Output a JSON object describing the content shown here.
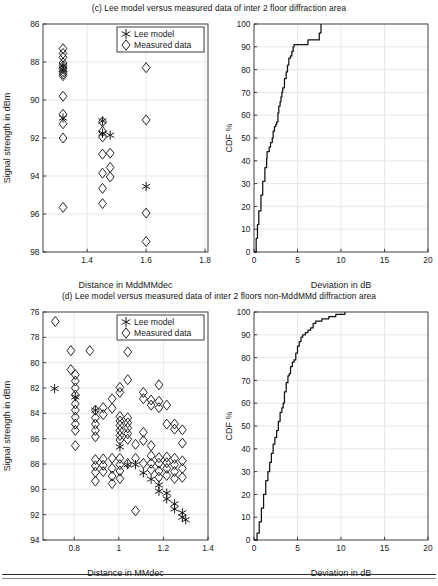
{
  "figure": {
    "panels": [
      {
        "id": "c",
        "caption": "(c) Lee model versus measured data of inter 2 floor diffraction area",
        "charts": [
          "c-scatter",
          "c-cdf"
        ]
      },
      {
        "id": "d",
        "caption": "(d) Lee model versus measured data of inter 2 floors non-MddMMd diffraction area",
        "charts": [
          "d-scatter",
          "d-cdf"
        ]
      }
    ],
    "legend_labels": {
      "lee_model": "Lee model",
      "measured_data": "Measured data"
    },
    "markers": {
      "lee_model": "asterisk",
      "measured_data": "diamond"
    },
    "colors": {
      "ink": "#1a1a1a",
      "axis": "#2b2b2b",
      "grid": "#d8d8d8",
      "curve": "#111111"
    }
  },
  "chart_data": [
    {
      "id": "c-scatter",
      "type": "scatter",
      "title": "(c) Lee model versus measured data of inter 2 floor diffraction area",
      "xlabel": "Distance in MddMMdec",
      "ylabel": "Signal strength in dBm",
      "xlim": [
        1.25,
        1.81
      ],
      "ylim": [
        86,
        98
      ],
      "y_inverted": true,
      "xticks": [
        1.4,
        1.6,
        1.8
      ],
      "xticklabels": [
        "1.4",
        "1.6",
        "1.8"
      ],
      "yticks": [
        86,
        88,
        90,
        92,
        94,
        96,
        98
      ],
      "yticklabels": [
        "86",
        "88",
        "90",
        "92",
        "94",
        "96",
        "98"
      ],
      "grid": true,
      "legend_position": "top-right",
      "series": [
        {
          "name": "Measured data",
          "marker": "diamond",
          "points": [
            [
              1.318,
              87.3
            ],
            [
              1.318,
              87.55
            ],
            [
              1.318,
              87.75
            ],
            [
              1.318,
              88.05
            ],
            [
              1.318,
              88.2
            ],
            [
              1.318,
              88.35
            ],
            [
              1.318,
              88.5
            ],
            [
              1.318,
              88.62
            ],
            [
              1.318,
              88.72
            ],
            [
              1.318,
              89.8
            ],
            [
              1.318,
              90.75
            ],
            [
              1.318,
              91.25
            ],
            [
              1.318,
              92.0
            ],
            [
              1.318,
              95.65
            ],
            [
              1.452,
              91.15
            ],
            [
              1.452,
              91.65
            ],
            [
              1.452,
              91.95
            ],
            [
              1.452,
              92.85
            ],
            [
              1.452,
              93.85
            ],
            [
              1.452,
              94.65
            ],
            [
              1.452,
              95.45
            ],
            [
              1.478,
              92.8
            ],
            [
              1.478,
              93.55
            ],
            [
              1.478,
              94.05
            ],
            [
              1.6,
              88.3
            ],
            [
              1.6,
              91.05
            ],
            [
              1.6,
              95.95
            ],
            [
              1.6,
              97.45
            ]
          ]
        },
        {
          "name": "Lee model",
          "marker": "asterisk",
          "points": [
            [
              1.318,
              88.2
            ],
            [
              1.318,
              88.4
            ],
            [
              1.318,
              90.95
            ],
            [
              1.452,
              91.1
            ],
            [
              1.452,
              91.75
            ],
            [
              1.478,
              91.85
            ],
            [
              1.6,
              94.55
            ]
          ]
        }
      ]
    },
    {
      "id": "c-cdf",
      "type": "line",
      "xlabel": "Deviation in dB",
      "ylabel": "CDF %",
      "xlim": [
        0,
        20
      ],
      "ylim": [
        0,
        100
      ],
      "xticks": [
        0,
        5,
        10,
        15,
        20
      ],
      "xticklabels": [
        "0",
        "5",
        "10",
        "15",
        "20"
      ],
      "yticks": [
        0,
        10,
        20,
        30,
        40,
        50,
        60,
        70,
        80,
        90,
        100
      ],
      "yticklabels": [
        "0",
        "10",
        "20",
        "30",
        "40",
        "50",
        "60",
        "70",
        "80",
        "90",
        "100"
      ],
      "grid": true,
      "series": [
        {
          "name": "CDF",
          "x": [
            0.05,
            0.25,
            0.4,
            0.55,
            0.8,
            1.0,
            1.25,
            1.45,
            1.5,
            1.75,
            1.9,
            2.1,
            2.2,
            2.35,
            2.5,
            2.6,
            2.75,
            2.85,
            3.0,
            3.1,
            3.2,
            3.3,
            3.45,
            3.5,
            3.7,
            3.85,
            4.0,
            4.2,
            4.35,
            4.5,
            4.6,
            6.1,
            6.2,
            6.45,
            7.4,
            7.5,
            7.65,
            7.7
          ],
          "y": [
            0,
            6,
            12,
            18,
            25,
            31,
            37,
            41,
            44,
            46,
            48,
            50,
            53,
            55,
            56,
            57,
            61,
            64,
            66,
            68,
            70,
            72,
            72,
            76,
            79,
            82,
            85,
            86,
            88,
            90,
            91,
            91,
            93,
            93,
            93,
            96,
            96,
            100
          ]
        }
      ]
    },
    {
      "id": "d-scatter",
      "type": "scatter",
      "title": "(d) Lee model versus measured data of inter 2 floors non-MddMMd diffraction area",
      "xlabel": "Distance in MMdec",
      "ylabel": "Signal strength in dBm",
      "xlim": [
        0.66,
        1.4
      ],
      "ylim": [
        76,
        94
      ],
      "y_inverted": true,
      "xticks": [
        0.8,
        1.0,
        1.2,
        1.4
      ],
      "xticklabels": [
        "0.8",
        "1",
        "1.2",
        "1.4"
      ],
      "yticks": [
        76,
        78,
        80,
        82,
        84,
        86,
        88,
        90,
        92,
        94
      ],
      "yticklabels": [
        "76",
        "78",
        "80",
        "82",
        "84",
        "86",
        "88",
        "90",
        "92",
        "94"
      ],
      "grid": true,
      "legend_position": "top-right",
      "series": [
        {
          "name": "Measured data",
          "marker": "diamond",
          "points": [
            [
              0.715,
              76.75
            ],
            [
              0.785,
              79.05
            ],
            [
              0.785,
              80.55
            ],
            [
              0.805,
              80.95
            ],
            [
              0.805,
              81.45
            ],
            [
              0.805,
              82.0
            ],
            [
              0.805,
              82.55
            ],
            [
              0.805,
              83.25
            ],
            [
              0.805,
              83.75
            ],
            [
              0.805,
              84.3
            ],
            [
              0.805,
              84.85
            ],
            [
              0.805,
              85.35
            ],
            [
              0.805,
              86.55
            ],
            [
              0.87,
              79.05
            ],
            [
              0.895,
              83.75
            ],
            [
              0.895,
              84.35
            ],
            [
              0.895,
              84.85
            ],
            [
              0.895,
              85.35
            ],
            [
              0.895,
              85.85
            ],
            [
              0.895,
              87.65
            ],
            [
              0.895,
              88.15
            ],
            [
              0.895,
              88.65
            ],
            [
              0.895,
              89.35
            ],
            [
              0.93,
              83.55
            ],
            [
              0.93,
              84.1
            ],
            [
              0.93,
              87.6
            ],
            [
              0.93,
              88.1
            ],
            [
              0.93,
              88.6
            ],
            [
              0.97,
              82.85
            ],
            [
              0.97,
              83.6
            ],
            [
              0.97,
              87.55
            ],
            [
              0.97,
              88.35
            ],
            [
              0.97,
              88.95
            ],
            [
              0.97,
              89.55
            ],
            [
              1.005,
              81.95
            ],
            [
              1.005,
              82.35
            ],
            [
              1.005,
              84.25
            ],
            [
              1.005,
              84.6
            ],
            [
              1.005,
              84.95
            ],
            [
              1.005,
              85.35
            ],
            [
              1.005,
              85.75
            ],
            [
              1.005,
              86.1
            ],
            [
              1.005,
              87.55
            ],
            [
              1.005,
              88.05
            ],
            [
              1.005,
              88.55
            ],
            [
              1.005,
              89.15
            ],
            [
              1.04,
              79.15
            ],
            [
              1.04,
              81.35
            ],
            [
              1.04,
              84.35
            ],
            [
              1.04,
              84.75
            ],
            [
              1.04,
              85.15
            ],
            [
              1.04,
              85.6
            ],
            [
              1.04,
              86.05
            ],
            [
              1.04,
              87.95
            ],
            [
              1.075,
              86.45
            ],
            [
              1.075,
              87.55
            ],
            [
              1.075,
              91.7
            ],
            [
              1.11,
              82.35
            ],
            [
              1.11,
              82.85
            ],
            [
              1.11,
              85.5
            ],
            [
              1.11,
              86.15
            ],
            [
              1.11,
              87.95
            ],
            [
              1.145,
              82.95
            ],
            [
              1.145,
              83.35
            ],
            [
              1.145,
              86.55
            ],
            [
              1.145,
              87.35
            ],
            [
              1.145,
              87.95
            ],
            [
              1.145,
              88.45
            ],
            [
              1.18,
              81.75
            ],
            [
              1.18,
              83.05
            ],
            [
              1.18,
              83.55
            ],
            [
              1.18,
              87.5
            ],
            [
              1.18,
              87.95
            ],
            [
              1.18,
              88.55
            ],
            [
              1.18,
              89.05
            ],
            [
              1.215,
              83.35
            ],
            [
              1.215,
              84.85
            ],
            [
              1.215,
              87.45
            ],
            [
              1.215,
              87.9
            ],
            [
              1.215,
              88.35
            ],
            [
              1.215,
              88.9
            ],
            [
              1.25,
              84.85
            ],
            [
              1.25,
              85.25
            ],
            [
              1.25,
              87.55
            ],
            [
              1.25,
              88.05
            ],
            [
              1.25,
              88.6
            ],
            [
              1.25,
              89.15
            ],
            [
              1.285,
              85.3
            ],
            [
              1.285,
              86.35
            ],
            [
              1.285,
              87.75
            ],
            [
              1.285,
              88.35
            ],
            [
              1.285,
              89.05
            ]
          ]
        },
        {
          "name": "Lee model",
          "marker": "asterisk",
          "points": [
            [
              0.712,
              82.05
            ],
            [
              0.805,
              82.7
            ],
            [
              0.895,
              83.75
            ],
            [
              1.005,
              86.65
            ],
            [
              1.04,
              88.05
            ],
            [
              1.075,
              88.05
            ],
            [
              1.11,
              88.7
            ],
            [
              1.145,
              89.2
            ],
            [
              1.18,
              89.65
            ],
            [
              1.18,
              90.15
            ],
            [
              1.215,
              90.3
            ],
            [
              1.215,
              90.75
            ],
            [
              1.25,
              91.15
            ],
            [
              1.25,
              91.55
            ],
            [
              1.285,
              91.85
            ],
            [
              1.285,
              92.2
            ],
            [
              1.3,
              92.4
            ]
          ]
        }
      ]
    },
    {
      "id": "d-cdf",
      "type": "line",
      "xlabel": "Deviation in dB",
      "ylabel": "CDF %",
      "xlim": [
        0,
        20
      ],
      "ylim": [
        0,
        100
      ],
      "xticks": [
        0,
        5,
        10,
        15,
        20
      ],
      "xticklabels": [
        "0",
        "5",
        "10",
        "15",
        "20"
      ],
      "yticks": [
        0,
        10,
        20,
        30,
        40,
        50,
        60,
        70,
        80,
        90,
        100
      ],
      "yticklabels": [
        "0",
        "10",
        "20",
        "30",
        "40",
        "50",
        "60",
        "70",
        "80",
        "90",
        "100"
      ],
      "grid": true,
      "series": [
        {
          "name": "CDF",
          "x": [
            0.1,
            0.35,
            0.6,
            0.85,
            1.1,
            1.35,
            1.6,
            1.8,
            2.0,
            2.2,
            2.4,
            2.6,
            2.8,
            3.0,
            3.2,
            3.35,
            3.5,
            3.7,
            3.9,
            4.05,
            4.2,
            4.4,
            4.6,
            4.8,
            5.0,
            5.2,
            5.4,
            5.6,
            5.9,
            6.2,
            6.5,
            6.8,
            7.1,
            7.4,
            7.8,
            8.2,
            8.6,
            9.0,
            9.4,
            9.8,
            10.2,
            10.45
          ],
          "y": [
            0,
            3,
            8,
            14,
            20,
            26,
            30,
            34,
            38,
            42,
            45,
            48,
            52,
            56,
            58,
            60,
            65,
            69,
            72,
            73,
            76,
            78,
            79,
            82,
            85,
            87,
            89,
            90,
            91,
            92,
            93,
            95,
            96,
            96,
            97,
            97,
            98,
            98,
            99,
            99,
            99,
            100
          ]
        }
      ]
    }
  ]
}
